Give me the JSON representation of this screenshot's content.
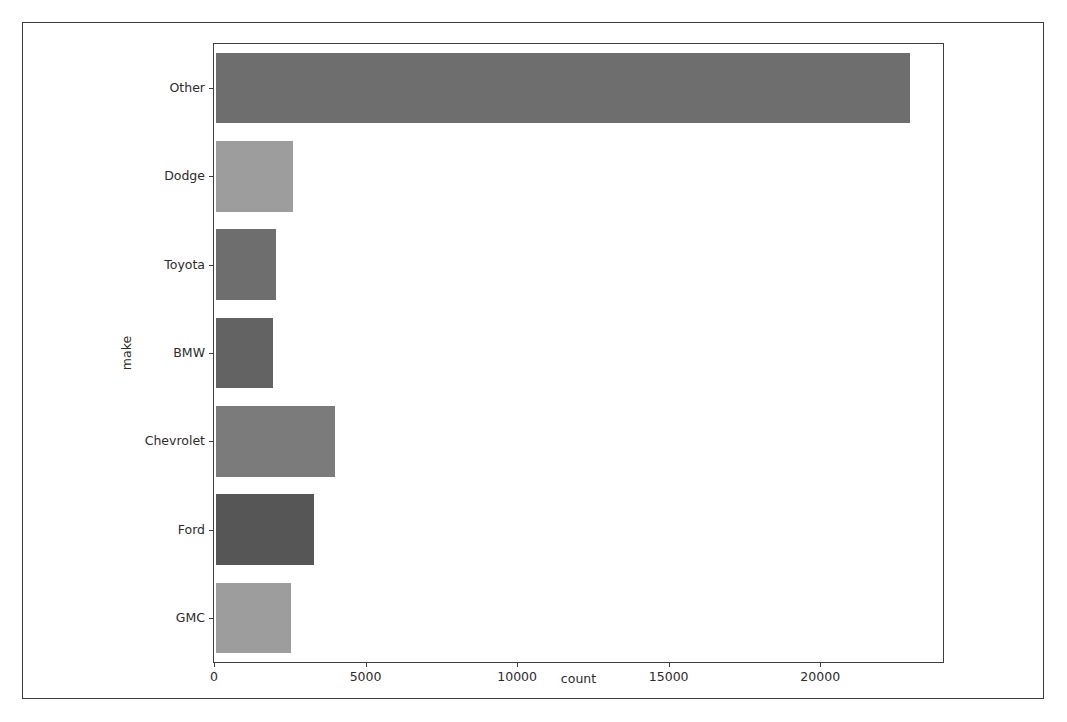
{
  "chart_data": {
    "type": "bar",
    "orientation": "horizontal",
    "title": "",
    "xlabel": "count",
    "ylabel": "make",
    "categories": [
      "Other",
      "Dodge",
      "Toyota",
      "BMW",
      "Chevrolet",
      "Ford",
      "GMC"
    ],
    "values": [
      22900,
      2530,
      1970,
      1870,
      3910,
      3220,
      2470
    ],
    "bar_colors": [
      "#6e6e6e",
      "#9d9d9d",
      "#6e6e6e",
      "#636363",
      "#7b7b7b",
      "#565656",
      "#9d9d9d"
    ],
    "xlim": [
      0,
      24050
    ],
    "xticks": [
      0,
      5000,
      10000,
      15000,
      20000
    ],
    "xtick_labels": [
      "0",
      "5000",
      "10000",
      "15000",
      "20000"
    ],
    "grid": false,
    "legend": null,
    "axes_edge_color": "#3f3f3f",
    "background_color": "#ffffff"
  },
  "frame": {
    "border_color": "#3b3b3b"
  }
}
